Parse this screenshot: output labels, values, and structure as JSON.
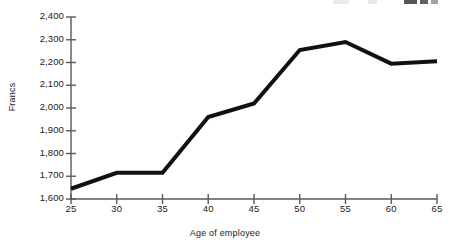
{
  "chart_data": {
    "type": "line",
    "title": "",
    "xlabel": "Age of employee",
    "ylabel": "Francs",
    "x": [
      25,
      30,
      35,
      40,
      45,
      50,
      55,
      60,
      65
    ],
    "values": [
      1645,
      1715,
      1715,
      1960,
      2020,
      2255,
      2290,
      2195,
      2205
    ],
    "series": [
      {
        "name": "Francs by age of employee",
        "values": [
          1645,
          1715,
          1715,
          1960,
          2020,
          2255,
          2290,
          2195,
          2205
        ]
      }
    ],
    "xlim": [
      25,
      65
    ],
    "ylim": [
      1600,
      2400
    ],
    "xtick_labels": [
      "25",
      "30",
      "35",
      "40",
      "45",
      "50",
      "55",
      "60",
      "65"
    ],
    "ytick_values": [
      1600,
      1700,
      1800,
      1900,
      2000,
      2100,
      2200,
      2300,
      2400
    ],
    "ytick_labels": [
      "1,600",
      "1,700",
      "1,800",
      "1,900",
      "2,000",
      "2,100",
      "2,200",
      "2,300",
      "2,400"
    ],
    "grid": false,
    "legend": "none",
    "line_color": "#111111",
    "axis_color": "#5a5a5a"
  },
  "axes": {
    "y_title": "Francs",
    "x_title": "Age of employee"
  }
}
